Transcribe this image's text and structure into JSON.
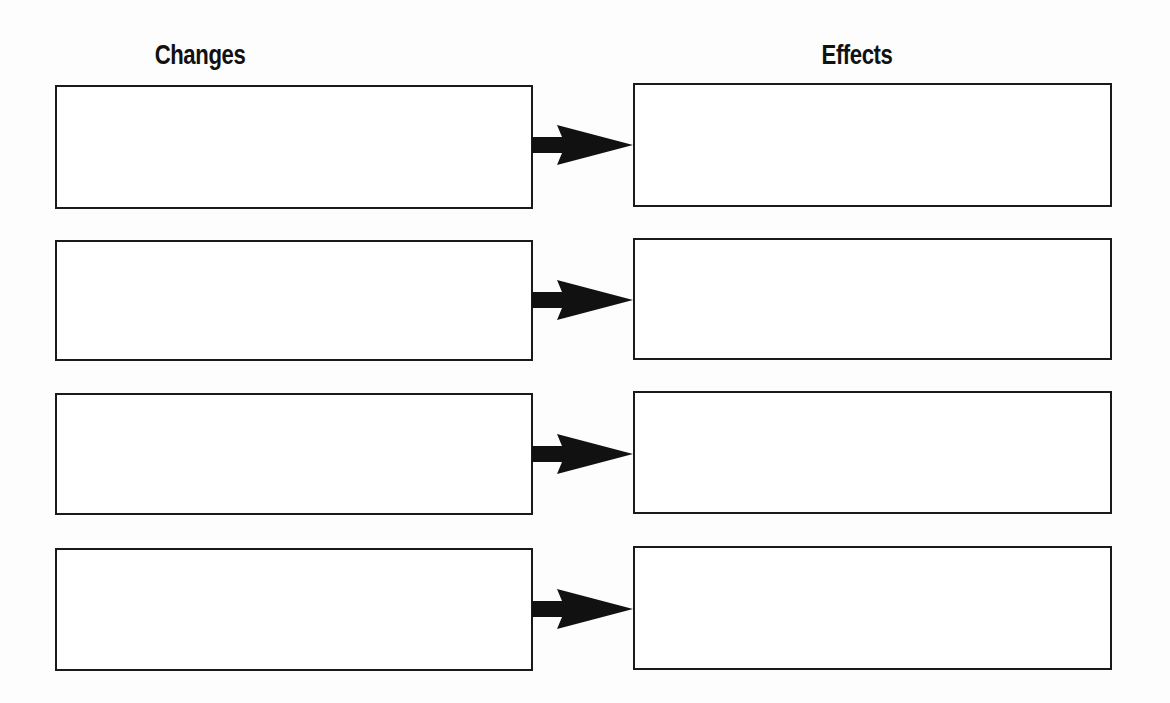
{
  "headers": {
    "left": "Changes",
    "right": "Effects"
  },
  "rows": [
    {
      "change": "",
      "effect": ""
    },
    {
      "change": "",
      "effect": ""
    },
    {
      "change": "",
      "effect": ""
    },
    {
      "change": "",
      "effect": ""
    }
  ],
  "colors": {
    "stroke": "#1a1a1a",
    "background": "#fdfdfd"
  },
  "icons": {
    "connector": "right-arrow-icon"
  }
}
